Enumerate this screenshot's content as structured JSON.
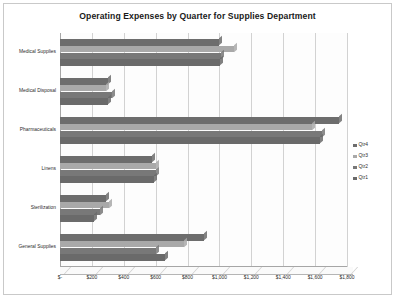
{
  "chart": {
    "title": "Operating Expenses by Quarter for Supplies Department"
  },
  "legend": {
    "position": "right",
    "items": [
      {
        "label": "Qtr4",
        "color": "#6d6d6d"
      },
      {
        "label": "Qtr3",
        "color": "#a9a9a9"
      },
      {
        "label": "Qtr2",
        "color": "#787878"
      },
      {
        "label": "Qtr1",
        "color": "#6a6a6a"
      }
    ]
  },
  "chart_data": {
    "type": "bar",
    "orientation": "horizontal",
    "title": "Operating Expenses by Quarter for Supplies Department",
    "xlabel": "",
    "ylabel": "",
    "xlim": [
      0,
      1800
    ],
    "grid": true,
    "legend_position": "right",
    "categories": [
      "Medical Supplies",
      "Medical Disposal",
      "Pharmaceuticals",
      "Linens",
      "Sterilization",
      "General Supplies"
    ],
    "tick_labels": [
      "$-",
      "$200",
      "$400",
      "$600",
      "$800",
      "$1,000",
      "$1,200",
      "$1,400",
      "$1,600",
      "$1,800"
    ],
    "tick_values": [
      0,
      200,
      400,
      600,
      800,
      1000,
      1200,
      1400,
      1600,
      1800
    ],
    "series": [
      {
        "name": "Qtr4",
        "color": "#6d6d6d",
        "values": [
          1000,
          300,
          1750,
          575,
          290,
          900
        ]
      },
      {
        "name": "Qtr3",
        "color": "#a9a9a9",
        "values": [
          1090,
          290,
          1580,
          605,
          305,
          775
        ]
      },
      {
        "name": "Qtr2",
        "color": "#787878",
        "values": [
          1010,
          325,
          1645,
          600,
          250,
          600
        ]
      },
      {
        "name": "Qtr1",
        "color": "#6a6a6a",
        "values": [
          1005,
          300,
          1630,
          590,
          215,
          660
        ]
      }
    ]
  }
}
